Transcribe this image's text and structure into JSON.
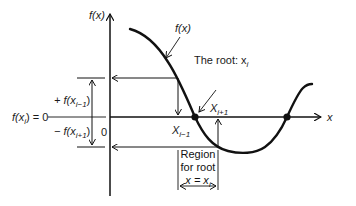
{
  "figure": {
    "y_axis_label": "f(x)",
    "x_axis_label": "x",
    "origin_label": "0",
    "curve_label": "f(x)",
    "root_label": "The root: x",
    "root_label_sub": "i",
    "f_xi_label": "f(x",
    "f_xi_sub": "i",
    "f_xi_tail": ") = 0",
    "plus_label": "+ f(x",
    "plus_sub": "i−1",
    "minus_label": "− f(x",
    "minus_sub": "i+1",
    "close_paren": ")",
    "x_im1_label": "X",
    "x_im1_sub": "i−1",
    "x_ip1_label": "X",
    "x_ip1_sub": "i+1",
    "region_line1": "Region",
    "region_line2": "for root",
    "region_line3": "x = x",
    "region_line3_sub": "i"
  },
  "colors": {
    "line": "#111111",
    "background": "#ffffff"
  }
}
